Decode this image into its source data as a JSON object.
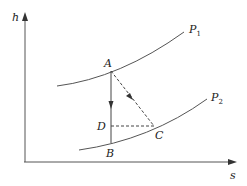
{
  "diagram": {
    "type": "h-s diagram",
    "axes": {
      "y_label": "h",
      "x_label": "s"
    },
    "curves": [
      {
        "name": "P",
        "sub": "1",
        "id": "P1"
      },
      {
        "name": "P",
        "sub": "2",
        "id": "P2"
      }
    ],
    "points": {
      "A": "A",
      "B": "B",
      "C": "C",
      "D": "D"
    },
    "colors": {
      "line": "#444444",
      "background": "#ffffff"
    }
  }
}
